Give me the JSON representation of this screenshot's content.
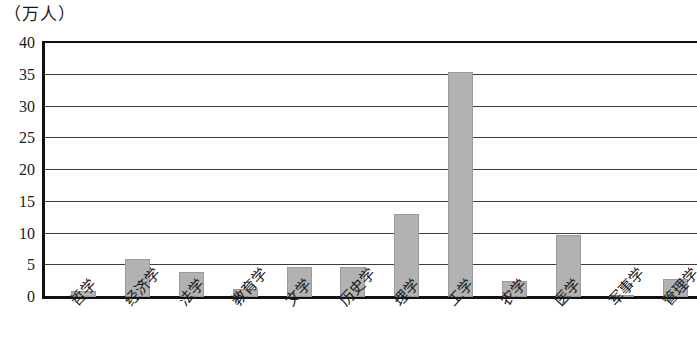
{
  "chart_data": {
    "type": "bar",
    "title": "（万人）",
    "xlabel": "",
    "ylabel": "（万人）",
    "ylim": [
      0,
      40
    ],
    "yticks": [
      0,
      5,
      10,
      15,
      20,
      25,
      30,
      35,
      40
    ],
    "grid": true,
    "legend": null,
    "bar_color": "#b2b2b2",
    "axis_color": "#111111",
    "categories": [
      "哲学",
      "经济学",
      "法学",
      "教育学",
      "文学",
      "历史学",
      "理学",
      "工学",
      "农学",
      "医学",
      "军事学",
      "管理学"
    ],
    "values": [
      1.0,
      6.0,
      4.0,
      1.3,
      4.8,
      4.8,
      13.0,
      35.5,
      2.5,
      9.7,
      0.2,
      2.8
    ]
  }
}
